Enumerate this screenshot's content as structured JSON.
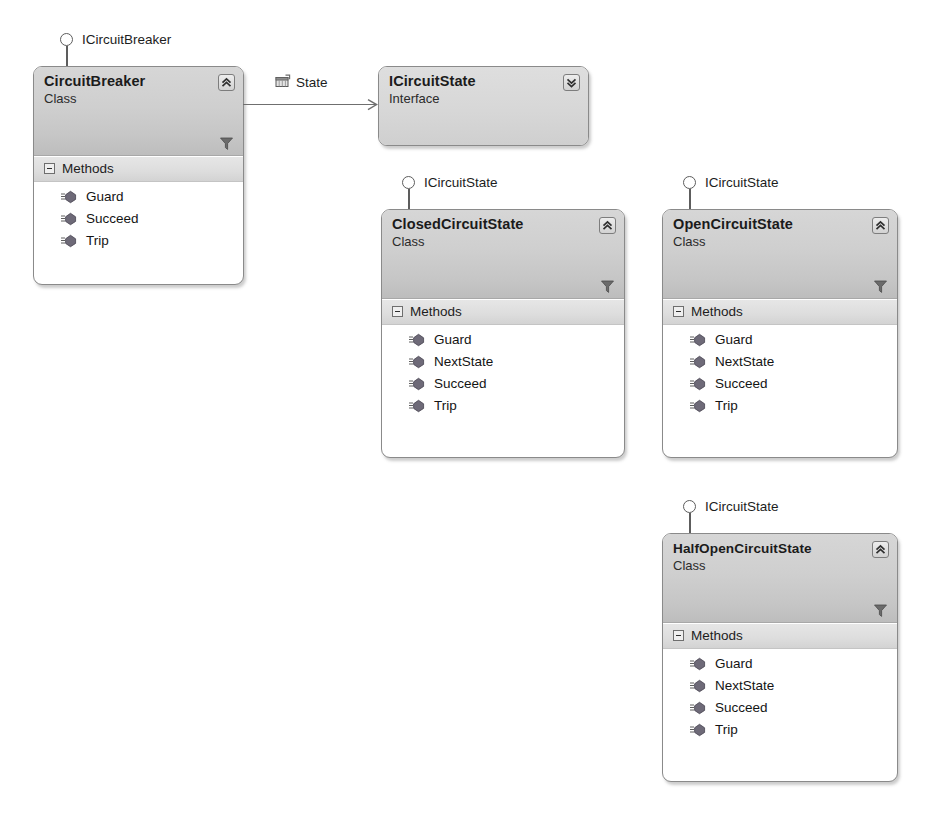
{
  "diagram": {
    "tool": "UML Class Designer",
    "colors": {
      "header_gradient_top": "#d6d6d6",
      "header_gradient_bottom": "#bdbdbd",
      "compartment_band": "#dddddd",
      "border": "#8a8a8a",
      "body": "#ffffff",
      "line": "#6f6f6f",
      "text": "#1b1b1b"
    }
  },
  "shapes": [
    {
      "id": "circuitbreaker",
      "name": "CircuitBreaker",
      "stereotype": "Class",
      "collapse_icon": "chevron-double-up-icon",
      "filter_icon": "funnel-icon",
      "lollipop": {
        "label": "ICircuitBreaker",
        "icon": "interface-lollipop-icon"
      },
      "compartments": [
        {
          "label": "Methods",
          "toggle_icon": "collapse-minus-icon",
          "members": [
            {
              "name": "Guard",
              "icon": "method-icon"
            },
            {
              "name": "Succeed",
              "icon": "method-icon"
            },
            {
              "name": "Trip",
              "icon": "method-icon"
            }
          ]
        }
      ]
    },
    {
      "id": "icircuitstate",
      "name": "ICircuitState",
      "stereotype": "Interface",
      "collapse_icon": "chevron-double-down-icon",
      "compartments": []
    },
    {
      "id": "closedcircuitstate",
      "name": "ClosedCircuitState",
      "stereotype": "Class",
      "collapse_icon": "chevron-double-up-icon",
      "filter_icon": "funnel-icon",
      "lollipop": {
        "label": "ICircuitState",
        "icon": "interface-lollipop-icon"
      },
      "compartments": [
        {
          "label": "Methods",
          "toggle_icon": "collapse-minus-icon",
          "members": [
            {
              "name": "Guard",
              "icon": "method-icon"
            },
            {
              "name": "NextState",
              "icon": "method-icon"
            },
            {
              "name": "Succeed",
              "icon": "method-icon"
            },
            {
              "name": "Trip",
              "icon": "method-icon"
            }
          ]
        }
      ]
    },
    {
      "id": "opencircuitstate",
      "name": "OpenCircuitState",
      "stereotype": "Class",
      "collapse_icon": "chevron-double-up-icon",
      "filter_icon": "funnel-icon",
      "lollipop": {
        "label": "ICircuitState",
        "icon": "interface-lollipop-icon"
      },
      "compartments": [
        {
          "label": "Methods",
          "toggle_icon": "collapse-minus-icon",
          "members": [
            {
              "name": "Guard",
              "icon": "method-icon"
            },
            {
              "name": "NextState",
              "icon": "method-icon"
            },
            {
              "name": "Succeed",
              "icon": "method-icon"
            },
            {
              "name": "Trip",
              "icon": "method-icon"
            }
          ]
        }
      ]
    },
    {
      "id": "halfopencircuitstate",
      "name": "HalfOpenCircuitState",
      "stereotype": "Class",
      "collapse_icon": "chevron-double-up-icon",
      "filter_icon": "funnel-icon",
      "lollipop": {
        "label": "ICircuitState",
        "icon": "interface-lollipop-icon"
      },
      "compartments": [
        {
          "label": "Methods",
          "toggle_icon": "collapse-minus-icon",
          "members": [
            {
              "name": "Guard",
              "icon": "method-icon"
            },
            {
              "name": "NextState",
              "icon": "method-icon"
            },
            {
              "name": "Succeed",
              "icon": "method-icon"
            },
            {
              "name": "Trip",
              "icon": "method-icon"
            }
          ]
        }
      ]
    }
  ],
  "associations": [
    {
      "id": "state-association",
      "label": "State",
      "icon": "property-icon",
      "from": "CircuitBreaker",
      "to": "ICircuitState",
      "arrow": "open-arrow-icon"
    }
  ]
}
